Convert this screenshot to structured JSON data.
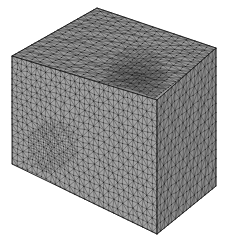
{
  "figure": {
    "title": "",
    "kind": "finite-element-mesh",
    "background_color": "#ffffff",
    "canvas": {
      "width": 226,
      "height": 242
    }
  },
  "geometry": {
    "projection": "oblique-isometric",
    "vertices_px": {
      "top_back": [
        97,
        8
      ],
      "top_left": [
        12,
        56
      ],
      "top_front": [
        157,
        100
      ],
      "top_right": [
        216,
        48
      ],
      "bottom_left": [
        12,
        164
      ],
      "bottom_front": [
        157,
        234
      ],
      "bottom_right": [
        216,
        186
      ]
    },
    "faces": [
      {
        "name": "top-face",
        "corners": [
          "top_back",
          "top_left",
          "top_front",
          "top_right"
        ],
        "fill": "#9a9a9a",
        "mesh_density": "graded"
      },
      {
        "name": "front-face",
        "corners": [
          "top_left",
          "top_front",
          "bottom_front",
          "bottom_left"
        ],
        "fill": "#a4a4a4",
        "mesh_density": "fine"
      },
      {
        "name": "right-face",
        "corners": [
          "top_front",
          "top_right",
          "bottom_right",
          "bottom_front"
        ],
        "fill": "#8c8c8c",
        "mesh_density": "coarse"
      }
    ]
  },
  "mesh_style": {
    "edge_color": "#2a2a2a",
    "edge_width": 0.45,
    "node_color": "#111111",
    "node_radius": 0.55
  },
  "refinement_regions": [
    {
      "name": "top-face-refinement",
      "face": "top-face",
      "center_px": [
        136,
        78
      ],
      "radius_px": 27,
      "tone": "#6f6f6f",
      "relative_density": "high"
    },
    {
      "name": "front-face-refinement",
      "face": "front-face",
      "center_px": [
        52,
        146
      ],
      "radius_px": 22,
      "tone": "#b9b9b9",
      "relative_density": "high"
    }
  ],
  "chart_data": {
    "type": "table",
    "categories": [
      "top-face",
      "front-face",
      "right-face"
    ],
    "series": [
      {
        "name": "base grid divisions",
        "values": [
          26,
          30,
          16
        ]
      },
      {
        "name": "refined cluster present",
        "values": [
          1,
          1,
          0
        ]
      }
    ],
    "xlabel": "face",
    "ylabel": "divisions",
    "legend_position": "none",
    "grid": false
  }
}
